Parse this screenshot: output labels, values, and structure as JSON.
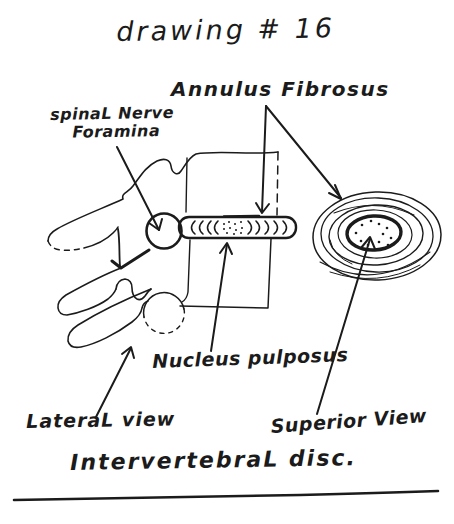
{
  "canvas": {
    "background": "#ffffff",
    "ink": "#1b1b1b"
  },
  "title": "drawing # 16",
  "labels": {
    "annulus_fibrosus": "Annulus Fibrosus",
    "spinal_nerve_line1": "spinaL Nerve",
    "spinal_nerve_line2": "Foramina",
    "nucleus_pulposus": "Nucleus pulposus",
    "lateral_view": "LateraL view",
    "superior_view": "Superior View"
  },
  "caption": "IntervertebraL disc.",
  "figures": {
    "lateral_view": "hand-drawn lateral view of two vertebrae with intervertebral disc, nerve foramina circles and posterior processes",
    "superior_view": "hand-drawn superior view of disc: concentric annulus rings around dotted nucleus"
  }
}
